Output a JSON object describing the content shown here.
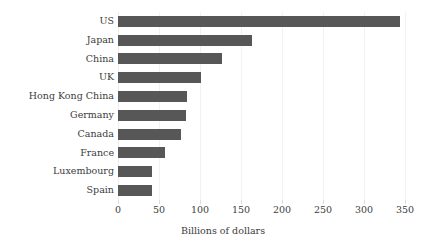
{
  "chart_data": {
    "type": "bar",
    "orientation": "horizontal",
    "title": "",
    "subtitle": "",
    "xlabel": "Billions of dollars",
    "ylabel": "",
    "categories": [
      "US",
      "Japan",
      "China",
      "UK",
      "Hong Kong China",
      "Germany",
      "Canada",
      "France",
      "Luxembourg",
      "Spain"
    ],
    "values": [
      344,
      163,
      127,
      101,
      84,
      83,
      77,
      57,
      41,
      41
    ],
    "xlim": [
      0,
      350
    ],
    "xticks": [
      0,
      50,
      100,
      150,
      200,
      250,
      300,
      350
    ],
    "xtick_labels": [
      "0",
      "50",
      "100",
      "150",
      "200",
      "250",
      "300",
      "350"
    ],
    "grid": true,
    "grid_axis": "x",
    "legend": false,
    "legend_position": "none",
    "bar_color": "#575757",
    "background_color": "#ffffff",
    "gridline_color": "#f2f2f2",
    "text_color": "#3c3c3c"
  }
}
